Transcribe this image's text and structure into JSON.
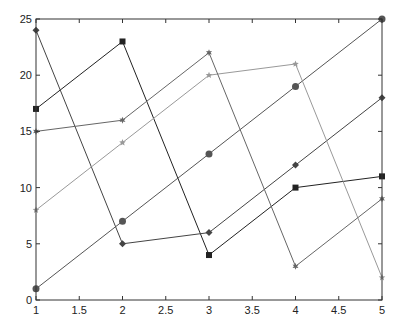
{
  "chart_data": {
    "type": "line",
    "title": "",
    "xlabel": "",
    "ylabel": "",
    "xlim": [
      1,
      5
    ],
    "ylim": [
      0,
      25
    ],
    "grid": false,
    "legend": null,
    "x": [
      1,
      2,
      3,
      4,
      5
    ],
    "xticks": [
      "1",
      "1.5",
      "2",
      "2.5",
      "3",
      "3.5",
      "4",
      "4.5",
      "5"
    ],
    "yticks": [
      "0",
      "5",
      "10",
      "15",
      "20",
      "25"
    ],
    "series": [
      {
        "name": "series-1",
        "values": [
          17,
          23,
          4,
          10,
          11
        ],
        "marker": "square",
        "color": "#222222"
      },
      {
        "name": "series-2",
        "values": [
          24,
          5,
          6,
          12,
          18
        ],
        "marker": "diamond",
        "color": "#444444"
      },
      {
        "name": "series-3",
        "values": [
          1,
          7,
          13,
          19,
          25
        ],
        "marker": "circle",
        "color": "#555555"
      },
      {
        "name": "series-4",
        "values": [
          8,
          14,
          20,
          21,
          2
        ],
        "marker": "star",
        "color": "#999999"
      },
      {
        "name": "series-5",
        "values": [
          15,
          16,
          22,
          3,
          9
        ],
        "marker": "hexagram",
        "color": "#666666"
      }
    ]
  },
  "axes": {
    "frame_color": "#333333"
  }
}
